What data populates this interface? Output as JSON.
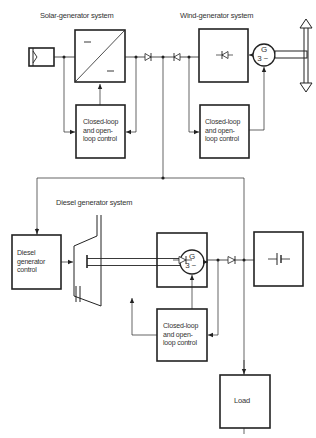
{
  "diagram": {
    "sections": {
      "solar": {
        "title": "Solar-generator system"
      },
      "wind": {
        "title": "Wind-generator system"
      },
      "diesel": {
        "title": "Diesel generator system"
      }
    },
    "blocks": {
      "solar_control": {
        "line1": "Closed-loop",
        "line2": "and open-",
        "line3": "loop control"
      },
      "wind_control": {
        "line1": "Closed-loop",
        "line2": "and open-",
        "line3": "loop control"
      },
      "diesel_control": {
        "line1": "Diesel",
        "line2": "generator",
        "line3": "control"
      },
      "battery_control": {
        "line1": "Closed-loop",
        "line2": "and open-",
        "line3": "loop control"
      },
      "load": {
        "label": "Load"
      }
    },
    "generators": {
      "wind_gen": {
        "letter": "G",
        "phase": "3 ~"
      },
      "diesel_gen": {
        "letter": "G",
        "phase": "3 ~"
      }
    },
    "icons": [
      "solar-panel-icon",
      "dc-dc-converter-icon",
      "diode-icon",
      "rectifier-icon",
      "generator-icon",
      "wind-rotor-icon",
      "diesel-engine-icon",
      "battery-icon"
    ],
    "colors": {
      "line": "#222222",
      "text": "#333333",
      "background": "#ffffff"
    }
  }
}
